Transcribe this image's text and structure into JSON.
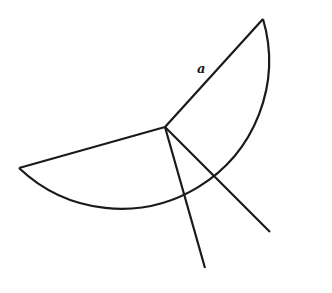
{
  "diagram": {
    "type": "circular-sector",
    "stroke_color": "#1a1a1a",
    "background": "#ffffff",
    "center": [
      165,
      127
    ],
    "radius": 148,
    "radius_label": "a",
    "radii_endpoints": [
      [
        263,
        19
      ],
      [
        270,
        232
      ],
      [
        205,
        268
      ],
      [
        19,
        168
      ]
    ]
  }
}
